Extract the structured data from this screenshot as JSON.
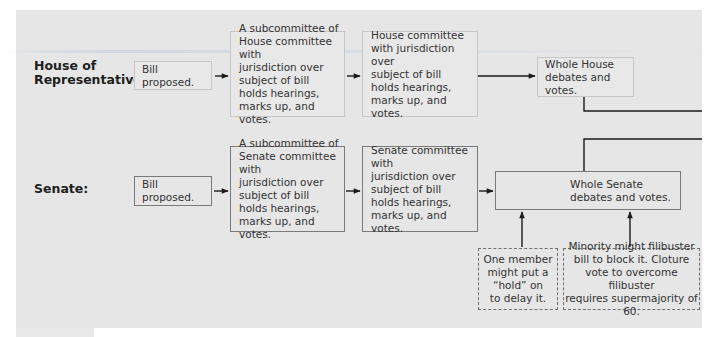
{
  "diagram": {
    "rows": [
      {
        "label": "House of\nRepresentatives:",
        "steps": [
          "Bill proposed.",
          "A subcommittee of\nHouse committee with\njurisdiction over\nsubject of bill\nholds hearings,\nmarks up, and votes.",
          "House committee\nwith jurisdiction over\nsubject of bill\nholds hearings,\nmarks up, and votes.",
          "Whole House\ndebates and votes."
        ]
      },
      {
        "label": "Senate:",
        "steps": [
          "Bill proposed.",
          "A subcommittee of\nSenate committee with\njurisdiction over\nsubject of bill\nholds hearings,\nmarks up, and votes.",
          "Senate committee with\njurisdiction over\nsubject of bill\nholds hearings,\nmarks up, and votes.",
          "Whole Senate\ndebates and votes."
        ]
      }
    ],
    "senate_obstacles": [
      "One member\nmight put a\n“hold” on\nto delay it.",
      "Minority might filibuster\nbill to block it. Cloture\nvote to overcome filibuster\nrequires supermajority of 60."
    ]
  },
  "colors": {
    "panel_background": "#e6e6e6",
    "line_color": "#1a1a1a"
  }
}
